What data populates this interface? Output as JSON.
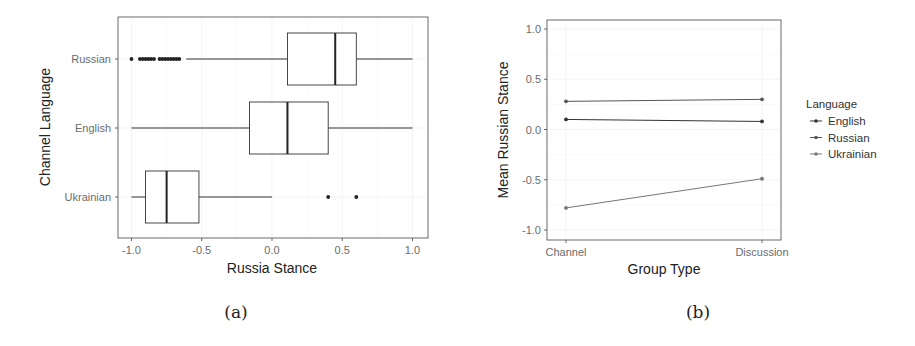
{
  "figure": {
    "captions": [
      "(a)",
      "(b)"
    ]
  },
  "chart_data": [
    {
      "type": "boxplot",
      "orientation": "horizontal",
      "title": "",
      "xlabel": "Russia Stance",
      "ylabel": "Channel Language",
      "xlim": [
        -1.1,
        1.1
      ],
      "xticks": [
        -1.0,
        -0.5,
        0.0,
        0.5,
        1.0
      ],
      "xtick_labels": [
        "-1.0",
        "-0.5",
        "0.0",
        "0.5",
        "1.0"
      ],
      "categories": [
        "Russian",
        "English",
        "Ukrainian"
      ],
      "grid": true,
      "boxes": [
        {
          "category": "Russian",
          "whisker_low": -0.61,
          "q1": 0.11,
          "median": 0.45,
          "q3": 0.6,
          "whisker_high": 1.0,
          "outliers": [
            -1.0,
            -0.94,
            -0.92,
            -0.9,
            -0.88,
            -0.86,
            -0.84,
            -0.8,
            -0.78,
            -0.76,
            -0.74,
            -0.72,
            -0.7,
            -0.68,
            -0.66
          ]
        },
        {
          "category": "English",
          "whisker_low": -1.0,
          "q1": -0.16,
          "median": 0.11,
          "q3": 0.4,
          "whisker_high": 1.0,
          "outliers": []
        },
        {
          "category": "Ukrainian",
          "whisker_low": -1.0,
          "q1": -0.9,
          "median": -0.75,
          "q3": -0.52,
          "whisker_high": 0.0,
          "outliers": [
            0.4,
            0.6
          ]
        }
      ],
      "caption": "(a)"
    },
    {
      "type": "line",
      "title": "",
      "xlabel": "Group Type",
      "ylabel": "Mean Russian Stance",
      "categories": [
        "Channel",
        "Discussion"
      ],
      "ylim": [
        -1.05,
        1.05
      ],
      "yticks": [
        1.0,
        0.5,
        0.0,
        -0.5,
        -1.0
      ],
      "ytick_labels": [
        "1.0",
        "0.5",
        "0.0",
        "-0.5",
        "-1.0"
      ],
      "grid": true,
      "legend": {
        "title": "Language",
        "position": "right",
        "entries": [
          "English",
          "Russian",
          "Ukrainian"
        ]
      },
      "series": [
        {
          "name": "Russian",
          "values": [
            0.28,
            0.3
          ],
          "color": "#555555"
        },
        {
          "name": "English",
          "values": [
            0.1,
            0.08
          ],
          "color": "#333333"
        },
        {
          "name": "Ukrainian",
          "values": [
            -0.78,
            -0.49
          ],
          "color": "#777777"
        }
      ],
      "caption": "(b)"
    }
  ]
}
